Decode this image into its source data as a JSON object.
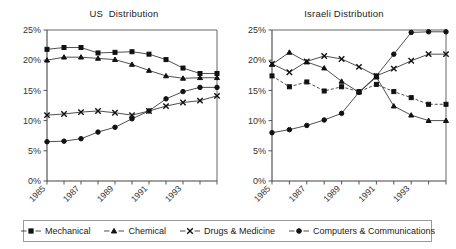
{
  "charts": [
    {
      "id": "us",
      "title": "US  Distribution"
    },
    {
      "id": "israeli",
      "title": "Israeli Distribution"
    }
  ],
  "legend": {
    "items": [
      {
        "label": "Mechanical",
        "marker": "square-marker",
        "dashed": false
      },
      {
        "label": "Chemical",
        "marker": "triangle-marker",
        "dashed": false
      },
      {
        "label": "Drugs & Medicine",
        "marker": "x-marker",
        "dashed": false
      },
      {
        "label": "Computers & Communications",
        "marker": "circle-marker",
        "dashed": false
      }
    ]
  },
  "axis": {
    "ytick_labels": [
      "25%",
      "20%",
      "15%",
      "10%",
      "5%",
      "0%"
    ],
    "xtick_labels": [
      "1985",
      "1987",
      "1989",
      "1991",
      "1993"
    ]
  },
  "chart_data": [
    {
      "type": "line",
      "title": "US  Distribution",
      "xlabel": "",
      "ylabel": "",
      "x": [
        1985,
        1986,
        1987,
        1988,
        1989,
        1990,
        1991,
        1992,
        1993,
        1994,
        1995
      ],
      "xlim": [
        1985,
        1995
      ],
      "ylim": [
        0,
        25
      ],
      "ytick_values": [
        0,
        5,
        10,
        15,
        20,
        25
      ],
      "ytick_labels": [
        "0%",
        "5%",
        "10%",
        "15%",
        "20%",
        "25%"
      ],
      "xtick_values": [
        1985,
        1987,
        1989,
        1991,
        1993
      ],
      "xtick_labels": [
        "1985",
        "1987",
        "1989",
        "1991",
        "1993"
      ],
      "grid": false,
      "legend_position": "bottom",
      "series": [
        {
          "name": "Mechanical",
          "marker": "square",
          "values": [
            21.8,
            22.1,
            22.1,
            21.2,
            21.3,
            21.4,
            21.0,
            20.1,
            18.7,
            17.8,
            17.8
          ]
        },
        {
          "name": "Chemical",
          "marker": "triangle",
          "values": [
            20.0,
            20.5,
            20.5,
            20.3,
            20.1,
            19.3,
            18.3,
            17.4,
            17.0,
            17.1,
            17.1
          ]
        },
        {
          "name": "Drugs & Medicine",
          "marker": "x",
          "values": [
            10.9,
            11.1,
            11.4,
            11.6,
            11.3,
            10.9,
            11.6,
            12.4,
            13.0,
            13.3,
            14.1
          ]
        },
        {
          "name": "Computers & Communications",
          "marker": "circle",
          "values": [
            6.5,
            6.6,
            7.0,
            8.1,
            8.9,
            10.3,
            11.6,
            13.6,
            14.8,
            15.5,
            15.5
          ]
        }
      ]
    },
    {
      "type": "line",
      "title": "Israeli Distribution",
      "xlabel": "",
      "ylabel": "",
      "x": [
        1985,
        1986,
        1987,
        1988,
        1989,
        1990,
        1991,
        1992,
        1993,
        1994,
        1995
      ],
      "xlim": [
        1985,
        1995
      ],
      "ylim": [
        0,
        25
      ],
      "ytick_values": [
        0,
        5,
        10,
        15,
        20,
        25
      ],
      "ytick_labels": [
        "0%",
        "5%",
        "10%",
        "15%",
        "20%",
        "25%"
      ],
      "xtick_values": [
        1985,
        1987,
        1989,
        1991,
        1993
      ],
      "xtick_labels": [
        "1985",
        "1987",
        "1989",
        "1991",
        "1993"
      ],
      "grid": false,
      "legend_position": "bottom",
      "series": [
        {
          "name": "Mechanical",
          "marker": "square",
          "dashed": true,
          "values": [
            17.4,
            15.6,
            16.4,
            14.9,
            15.6,
            14.8,
            16.0,
            14.8,
            13.8,
            12.7,
            12.7
          ]
        },
        {
          "name": "Chemical",
          "marker": "triangle",
          "values": [
            19.3,
            21.3,
            19.7,
            18.7,
            16.5,
            14.7,
            17.2,
            12.4,
            10.9,
            10.0,
            10.0
          ]
        },
        {
          "name": "Drugs & Medicine",
          "marker": "x",
          "values": [
            19.4,
            18.0,
            19.8,
            20.7,
            20.2,
            18.9,
            17.4,
            18.6,
            19.9,
            21.0,
            21.0
          ]
        },
        {
          "name": "Computers & Communications",
          "marker": "circle",
          "values": [
            8.0,
            8.5,
            9.2,
            10.1,
            11.2,
            14.7,
            17.4,
            21.0,
            24.6,
            24.7,
            24.7
          ]
        }
      ]
    }
  ]
}
